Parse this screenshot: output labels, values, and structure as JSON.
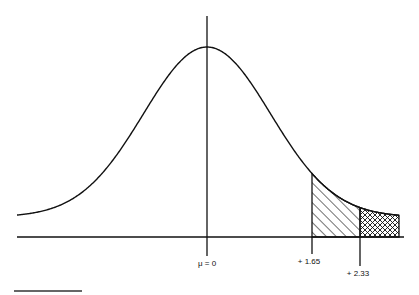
{
  "chart_data": {
    "type": "line",
    "title": "",
    "distribution": "normal",
    "mean_label": "μ = 0",
    "x_ticks": [
      {
        "value": 0,
        "label": "μ = 0"
      },
      {
        "value": 1.65,
        "label": "+ 1.65"
      },
      {
        "value": 2.33,
        "label": "+ 2.33"
      }
    ],
    "shaded_regions": [
      {
        "from": 1.65,
        "to": 2.33,
        "pattern": "diagonal-hatch"
      },
      {
        "from": 2.33,
        "to": "tail",
        "pattern": "cross-hatch"
      }
    ],
    "xlabel": "",
    "ylabel": "",
    "grid": false,
    "legend": null
  },
  "labels": {
    "mean": "μ = 0",
    "z165": "+ 1.65",
    "z233": "+ 2.33"
  },
  "style": {
    "line_color": "#111111",
    "background": "#ffffff"
  }
}
